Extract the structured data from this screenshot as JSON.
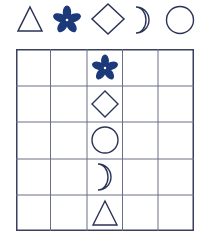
{
  "colors": {
    "outline": "#2b3356",
    "flower_fill": "#1c3a7a",
    "grid_line": "#3a3f5c",
    "background": "#ffffff"
  },
  "legend": {
    "shapes": [
      "triangle",
      "flower",
      "diamond",
      "crescent-moon",
      "circle"
    ]
  },
  "grid": {
    "rows": 5,
    "cols": 5,
    "cells": [
      {
        "row": 0,
        "col": 2,
        "shape": "flower"
      },
      {
        "row": 1,
        "col": 2,
        "shape": "diamond"
      },
      {
        "row": 2,
        "col": 2,
        "shape": "circle"
      },
      {
        "row": 3,
        "col": 2,
        "shape": "crescent-moon"
      },
      {
        "row": 4,
        "col": 2,
        "shape": "triangle"
      }
    ]
  }
}
